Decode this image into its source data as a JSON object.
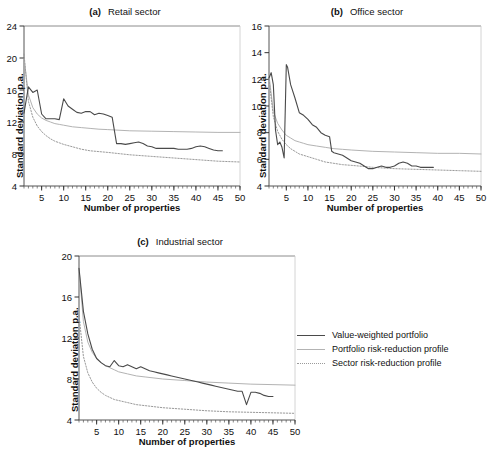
{
  "figure": {
    "axis_x_label": "Number of properties",
    "axis_y_label": "Standard deviation p.a."
  },
  "legend": {
    "position": "right-middle",
    "items": [
      {
        "label": "Value-weighted portfolio",
        "style": "solid",
        "color": "#4a4a4a",
        "width": 1.2
      },
      {
        "label": "Portfolio risk-reduction profile",
        "style": "solid",
        "color": "#b3b3b3",
        "width": 1.1
      },
      {
        "label": "Sector risk-reduction profile",
        "style": "dotted",
        "color": "#9a9a9a",
        "width": 1.0
      }
    ]
  },
  "chart_data": [
    {
      "type": "line",
      "panel": "a",
      "panel_label": "(a)",
      "title": "Retail sector",
      "xlabel": "Number of properties",
      "ylabel": "Standard deviation p.a.",
      "xlim": [
        1,
        50
      ],
      "ylim": [
        4,
        24
      ],
      "xticks": [
        5,
        10,
        15,
        20,
        25,
        30,
        35,
        40,
        45,
        50
      ],
      "yticks": [
        4,
        8,
        12,
        16,
        20,
        24
      ],
      "minor_xtick_step": 1,
      "grid": false,
      "series": [
        {
          "name": "Value-weighted portfolio",
          "style": "solid",
          "color": "#4a4a4a",
          "x": [
            1,
            2,
            3,
            4,
            5,
            6,
            7,
            8,
            9,
            10,
            11,
            12,
            13,
            14,
            15,
            16,
            17,
            18,
            19,
            20,
            21,
            22,
            23,
            24,
            25,
            26,
            27,
            28,
            29,
            30,
            31,
            32,
            33,
            34,
            35,
            36,
            37,
            38,
            39,
            40,
            41,
            42,
            43,
            44,
            45,
            46
          ],
          "y": [
            13.1,
            16.4,
            15.7,
            16.0,
            13.0,
            12.4,
            12.4,
            12.4,
            12.3,
            14.9,
            14.0,
            13.6,
            13.2,
            13.1,
            13.3,
            13.3,
            12.9,
            13.1,
            13.0,
            12.8,
            12.6,
            9.3,
            9.3,
            9.2,
            9.3,
            9.4,
            9.5,
            9.3,
            9.0,
            8.9,
            8.7,
            8.7,
            8.7,
            8.7,
            8.7,
            8.6,
            8.6,
            8.6,
            8.7,
            8.9,
            9.0,
            8.9,
            8.7,
            8.5,
            8.4,
            8.4
          ]
        },
        {
          "name": "Portfolio risk-reduction profile",
          "style": "solid",
          "color": "#b3b3b3",
          "x": [
            1,
            2,
            3,
            4,
            5,
            6,
            7,
            8,
            9,
            10,
            12,
            14,
            16,
            18,
            20,
            25,
            30,
            35,
            40,
            45,
            50
          ],
          "y": [
            20.0,
            15.4,
            13.8,
            13.0,
            12.5,
            12.2,
            12.0,
            11.8,
            11.7,
            11.6,
            11.4,
            11.3,
            11.2,
            11.1,
            11.05,
            10.9,
            10.85,
            10.8,
            10.75,
            10.7,
            10.7
          ]
        },
        {
          "name": "Sector risk-reduction profile",
          "style": "dotted",
          "color": "#9a9a9a",
          "x": [
            1,
            2,
            3,
            4,
            5,
            6,
            7,
            8,
            9,
            10,
            12,
            14,
            16,
            18,
            20,
            25,
            30,
            35,
            40,
            45,
            50
          ],
          "y": [
            20.5,
            14.6,
            12.6,
            11.5,
            10.8,
            10.3,
            9.9,
            9.6,
            9.4,
            9.2,
            8.9,
            8.6,
            8.4,
            8.3,
            8.2,
            7.9,
            7.7,
            7.5,
            7.3,
            7.1,
            7.0
          ]
        }
      ]
    },
    {
      "type": "line",
      "panel": "b",
      "panel_label": "(b)",
      "title": "Office sector",
      "xlabel": "Number of properties",
      "ylabel": "Standard deviation p.a.",
      "xlim": [
        1,
        50
      ],
      "ylim": [
        4,
        16
      ],
      "xticks": [
        5,
        10,
        15,
        20,
        25,
        30,
        35,
        40,
        45,
        50
      ],
      "yticks": [
        4,
        6,
        8,
        10,
        12,
        14,
        16
      ],
      "minor_xtick_step": 1,
      "grid": false,
      "series": [
        {
          "name": "Value-weighted portfolio",
          "style": "solid",
          "color": "#4a4a4a",
          "x": [
            1,
            1.5,
            2,
            2.5,
            3,
            3.5,
            4,
            4.5,
            5,
            5.3,
            6,
            7,
            8,
            9,
            10,
            11,
            12,
            13,
            14,
            15,
            15.5,
            16,
            17,
            18,
            19,
            20,
            21,
            22,
            23,
            24,
            25,
            26,
            27,
            28,
            29,
            30,
            31,
            32,
            33,
            34,
            35,
            36,
            37,
            38,
            39
          ],
          "y": [
            12.1,
            12.5,
            11.6,
            8.2,
            7.1,
            7.3,
            6.9,
            6.1,
            13.1,
            12.9,
            11.6,
            10.6,
            9.5,
            9.3,
            9.0,
            8.6,
            8.4,
            8.0,
            7.8,
            7.7,
            6.6,
            6.5,
            6.4,
            6.3,
            6.1,
            5.9,
            5.8,
            5.7,
            5.5,
            5.3,
            5.3,
            5.4,
            5.5,
            5.4,
            5.4,
            5.5,
            5.7,
            5.8,
            5.7,
            5.5,
            5.5,
            5.4,
            5.4,
            5.4,
            5.4
          ]
        },
        {
          "name": "Portfolio risk-reduction profile",
          "style": "solid",
          "color": "#b3b3b3",
          "x": [
            1,
            2,
            3,
            4,
            5,
            6,
            7,
            8,
            9,
            10,
            12,
            14,
            16,
            18,
            20,
            25,
            30,
            35,
            40,
            45,
            50
          ],
          "y": [
            12.3,
            9.6,
            8.7,
            8.2,
            7.8,
            7.6,
            7.4,
            7.3,
            7.2,
            7.1,
            7.0,
            6.9,
            6.8,
            6.75,
            6.7,
            6.6,
            6.55,
            6.5,
            6.45,
            6.45,
            6.4
          ]
        },
        {
          "name": "Sector risk-reduction profile",
          "style": "dotted",
          "color": "#9a9a9a",
          "x": [
            1,
            2,
            3,
            4,
            5,
            6,
            7,
            8,
            9,
            10,
            12,
            14,
            16,
            18,
            20,
            25,
            30,
            35,
            40,
            45,
            50
          ],
          "y": [
            12.0,
            9.2,
            8.1,
            7.5,
            7.1,
            6.8,
            6.6,
            6.4,
            6.3,
            6.2,
            6.0,
            5.8,
            5.7,
            5.6,
            5.55,
            5.4,
            5.3,
            5.25,
            5.2,
            5.15,
            5.1
          ]
        }
      ]
    },
    {
      "type": "line",
      "panel": "c",
      "panel_label": "(c)",
      "title": "Industrial sector",
      "xlabel": "Number of properties",
      "ylabel": "Standard deviation p.a.",
      "xlim": [
        1,
        50
      ],
      "ylim": [
        4,
        20
      ],
      "xticks": [
        5,
        10,
        15,
        20,
        25,
        30,
        35,
        40,
        45,
        50
      ],
      "yticks": [
        4,
        8,
        12,
        16,
        20
      ],
      "minor_xtick_step": 1,
      "grid": false,
      "series": [
        {
          "name": "Value-weighted portfolio",
          "style": "solid",
          "color": "#4a4a4a",
          "x": [
            1,
            2,
            3,
            4,
            5,
            6,
            7,
            8,
            9,
            10,
            11,
            12,
            13,
            14,
            15,
            16,
            17,
            18,
            19,
            20,
            21,
            22,
            23,
            24,
            25,
            26,
            27,
            28,
            29,
            30,
            31,
            32,
            33,
            34,
            35,
            36,
            37,
            38,
            39,
            40,
            41,
            42,
            43,
            44,
            45
          ],
          "y": [
            18.8,
            14.6,
            12.4,
            10.9,
            10.0,
            9.6,
            9.3,
            9.2,
            9.8,
            9.3,
            9.2,
            9.4,
            9.2,
            9.0,
            9.2,
            9.0,
            8.8,
            8.7,
            8.6,
            8.5,
            8.4,
            8.3,
            8.2,
            8.1,
            8.0,
            7.9,
            7.8,
            7.7,
            7.6,
            7.5,
            7.4,
            7.3,
            7.2,
            7.1,
            7.0,
            6.9,
            6.8,
            6.8,
            5.5,
            6.7,
            6.7,
            6.6,
            6.4,
            6.3,
            6.3
          ]
        },
        {
          "name": "Portfolio risk-reduction profile",
          "style": "solid",
          "color": "#b3b3b3",
          "x": [
            1,
            2,
            3,
            4,
            5,
            6,
            7,
            8,
            9,
            10,
            12,
            14,
            16,
            18,
            20,
            25,
            30,
            35,
            40,
            45,
            50
          ],
          "y": [
            18.8,
            13.6,
            11.6,
            10.6,
            10.0,
            9.6,
            9.3,
            9.1,
            8.9,
            8.7,
            8.5,
            8.3,
            8.2,
            8.1,
            8.0,
            7.85,
            7.7,
            7.6,
            7.5,
            7.45,
            7.4
          ]
        },
        {
          "name": "Sector risk-reduction profile",
          "style": "dotted",
          "color": "#9a9a9a",
          "x": [
            1,
            2,
            3,
            4,
            5,
            6,
            7,
            8,
            9,
            10,
            12,
            14,
            16,
            18,
            20,
            25,
            30,
            35,
            40,
            45,
            50
          ],
          "y": [
            14.2,
            10.2,
            8.6,
            7.7,
            7.1,
            6.7,
            6.4,
            6.2,
            6.0,
            5.9,
            5.7,
            5.5,
            5.4,
            5.3,
            5.2,
            5.05,
            4.9,
            4.8,
            4.75,
            4.7,
            4.65
          ]
        }
      ]
    }
  ]
}
